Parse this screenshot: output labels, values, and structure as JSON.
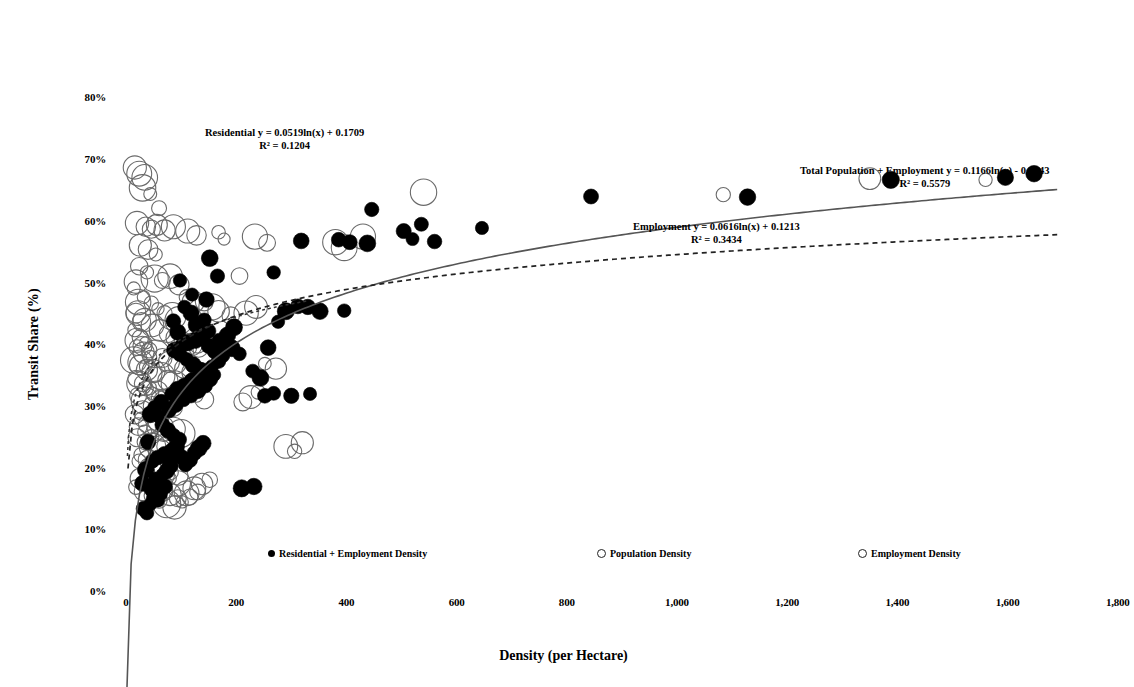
{
  "chart_data": {
    "type": "scatter",
    "title": "",
    "xlabel": "Density (per Hectare)",
    "ylabel": "Transit Share (%)",
    "xlim": [
      0,
      1800
    ],
    "ylim": [
      0,
      0.8
    ],
    "grid": false,
    "legend_position": "bottom",
    "xticks": [
      "0",
      "200",
      "400",
      "600",
      "800",
      "1,000",
      "1,200",
      "1,400",
      "1,600",
      "1,800"
    ],
    "xtick_values": [
      0,
      200,
      400,
      600,
      800,
      1000,
      1200,
      1400,
      1600,
      1800
    ],
    "yticks": [
      "0%",
      "10%",
      "20%",
      "30%",
      "40%",
      "50%",
      "60%",
      "70%",
      "80%"
    ],
    "ytick_values": [
      0,
      0.1,
      0.2,
      0.3,
      0.4,
      0.5,
      0.6,
      0.7,
      0.8
    ],
    "series": [
      {
        "name": "Residential + Employment Density",
        "marker": "filled-circle",
        "color": "#000000",
        "points": [
          [
            32,
            0.135
          ],
          [
            38,
            0.128
          ],
          [
            44,
            0.142
          ],
          [
            50,
            0.152
          ],
          [
            46,
            0.166
          ],
          [
            58,
            0.148
          ],
          [
            62,
            0.159
          ],
          [
            70,
            0.171
          ],
          [
            54,
            0.183
          ],
          [
            66,
            0.19
          ],
          [
            74,
            0.196
          ],
          [
            80,
            0.205
          ],
          [
            48,
            0.212
          ],
          [
            58,
            0.218
          ],
          [
            70,
            0.224
          ],
          [
            84,
            0.229
          ],
          [
            92,
            0.236
          ],
          [
            100,
            0.219
          ],
          [
            108,
            0.206
          ],
          [
            116,
            0.214
          ],
          [
            124,
            0.225
          ],
          [
            132,
            0.233
          ],
          [
            140,
            0.241
          ],
          [
            96,
            0.247
          ],
          [
            86,
            0.254
          ],
          [
            76,
            0.262
          ],
          [
            66,
            0.271
          ],
          [
            58,
            0.285
          ],
          [
            78,
            0.295
          ],
          [
            90,
            0.303
          ],
          [
            104,
            0.312
          ],
          [
            118,
            0.318
          ],
          [
            130,
            0.327
          ],
          [
            144,
            0.334
          ],
          [
            152,
            0.345
          ],
          [
            160,
            0.352
          ],
          [
            136,
            0.361
          ],
          [
            122,
            0.368
          ],
          [
            110,
            0.377
          ],
          [
            98,
            0.385
          ],
          [
            88,
            0.392
          ],
          [
            100,
            0.399
          ],
          [
            112,
            0.404
          ],
          [
            126,
            0.408
          ],
          [
            138,
            0.412
          ],
          [
            150,
            0.399
          ],
          [
            162,
            0.391
          ],
          [
            174,
            0.384
          ],
          [
            168,
            0.374
          ],
          [
            156,
            0.366
          ],
          [
            146,
            0.356
          ],
          [
            134,
            0.349
          ],
          [
            120,
            0.342
          ],
          [
            106,
            0.335
          ],
          [
            94,
            0.328
          ],
          [
            82,
            0.321
          ],
          [
            128,
            0.433
          ],
          [
            142,
            0.441
          ],
          [
            118,
            0.452
          ],
          [
            106,
            0.462
          ],
          [
            150,
            0.423
          ],
          [
            94,
            0.421
          ],
          [
            86,
            0.439
          ],
          [
            170,
            0.407
          ],
          [
            184,
            0.416
          ],
          [
            196,
            0.429
          ],
          [
            210,
            0.168
          ],
          [
            232,
            0.171
          ],
          [
            252,
            0.318
          ],
          [
            268,
            0.322
          ],
          [
            300,
            0.318
          ],
          [
            334,
            0.321
          ],
          [
            258,
            0.396
          ],
          [
            276,
            0.438
          ],
          [
            290,
            0.455
          ],
          [
            312,
            0.463
          ],
          [
            330,
            0.462
          ],
          [
            352,
            0.455
          ],
          [
            396,
            0.456
          ],
          [
            268,
            0.518
          ],
          [
            318,
            0.569
          ],
          [
            386,
            0.571
          ],
          [
            406,
            0.567
          ],
          [
            438,
            0.565
          ],
          [
            446,
            0.62
          ],
          [
            504,
            0.585
          ],
          [
            520,
            0.572
          ],
          [
            536,
            0.596
          ],
          [
            560,
            0.568
          ],
          [
            646,
            0.59
          ],
          [
            844,
            0.641
          ],
          [
            1128,
            0.64
          ],
          [
            1388,
            0.668
          ],
          [
            1596,
            0.672
          ],
          [
            1648,
            0.678
          ],
          [
            166,
            0.512
          ],
          [
            152,
            0.541
          ],
          [
            98,
            0.505
          ],
          [
            120,
            0.482
          ],
          [
            146,
            0.474
          ],
          [
            230,
            0.358
          ],
          [
            244,
            0.347
          ],
          [
            206,
            0.386
          ],
          [
            192,
            0.395
          ],
          [
            64,
            0.308
          ],
          [
            52,
            0.299
          ],
          [
            44,
            0.288
          ],
          [
            40,
            0.243
          ],
          [
            36,
            0.198
          ],
          [
            30,
            0.176
          ]
        ]
      },
      {
        "name": "Population Density",
        "marker": "hollow-circle",
        "color": "#666666",
        "points": [
          [
            16,
            0.688
          ],
          [
            24,
            0.678
          ],
          [
            34,
            0.672
          ],
          [
            30,
            0.655
          ],
          [
            44,
            0.645
          ],
          [
            60,
            0.622
          ],
          [
            20,
            0.598
          ],
          [
            36,
            0.592
          ],
          [
            46,
            0.588
          ],
          [
            56,
            0.595
          ],
          [
            70,
            0.586
          ],
          [
            86,
            0.592
          ],
          [
            112,
            0.585
          ],
          [
            128,
            0.578
          ],
          [
            168,
            0.583
          ],
          [
            178,
            0.572
          ],
          [
            234,
            0.576
          ],
          [
            256,
            0.566
          ],
          [
            26,
            0.562
          ],
          [
            40,
            0.555
          ],
          [
            54,
            0.547
          ],
          [
            24,
            0.528
          ],
          [
            38,
            0.518
          ],
          [
            52,
            0.508
          ],
          [
            66,
            0.505
          ],
          [
            80,
            0.512
          ],
          [
            96,
            0.498
          ],
          [
            18,
            0.503
          ],
          [
            110,
            0.478
          ],
          [
            122,
            0.47
          ],
          [
            32,
            0.478
          ],
          [
            46,
            0.468
          ],
          [
            58,
            0.459
          ],
          [
            70,
            0.452
          ],
          [
            84,
            0.447
          ],
          [
            96,
            0.44
          ],
          [
            22,
            0.452
          ],
          [
            34,
            0.441
          ],
          [
            48,
            0.432
          ],
          [
            62,
            0.424
          ],
          [
            76,
            0.418
          ],
          [
            90,
            0.412
          ],
          [
            104,
            0.406
          ],
          [
            118,
            0.401
          ],
          [
            132,
            0.396
          ],
          [
            146,
            0.392
          ],
          [
            20,
            0.408
          ],
          [
            30,
            0.399
          ],
          [
            42,
            0.392
          ],
          [
            54,
            0.386
          ],
          [
            66,
            0.379
          ],
          [
            78,
            0.373
          ],
          [
            92,
            0.368
          ],
          [
            106,
            0.362
          ],
          [
            120,
            0.356
          ],
          [
            134,
            0.349
          ],
          [
            26,
            0.372
          ],
          [
            38,
            0.365
          ],
          [
            50,
            0.358
          ],
          [
            64,
            0.35
          ],
          [
            76,
            0.343
          ],
          [
            88,
            0.337
          ],
          [
            100,
            0.33
          ],
          [
            114,
            0.324
          ],
          [
            128,
            0.318
          ],
          [
            142,
            0.312
          ],
          [
            24,
            0.338
          ],
          [
            36,
            0.33
          ],
          [
            48,
            0.322
          ],
          [
            60,
            0.314
          ],
          [
            72,
            0.307
          ],
          [
            86,
            0.299
          ],
          [
            30,
            0.294
          ],
          [
            44,
            0.286
          ],
          [
            58,
            0.278
          ],
          [
            72,
            0.271
          ],
          [
            86,
            0.264
          ],
          [
            100,
            0.257
          ],
          [
            22,
            0.268
          ],
          [
            34,
            0.259
          ],
          [
            46,
            0.251
          ],
          [
            60,
            0.243
          ],
          [
            74,
            0.236
          ],
          [
            88,
            0.228
          ],
          [
            28,
            0.222
          ],
          [
            40,
            0.214
          ],
          [
            54,
            0.207
          ],
          [
            68,
            0.2
          ],
          [
            82,
            0.194
          ],
          [
            96,
            0.188
          ],
          [
            26,
            0.184
          ],
          [
            38,
            0.176
          ],
          [
            52,
            0.17
          ],
          [
            66,
            0.164
          ],
          [
            80,
            0.158
          ],
          [
            94,
            0.152
          ],
          [
            110,
            0.16
          ],
          [
            124,
            0.168
          ],
          [
            138,
            0.175
          ],
          [
            152,
            0.182
          ],
          [
            252,
            0.37
          ],
          [
            272,
            0.362
          ],
          [
            290,
            0.236
          ],
          [
            306,
            0.228
          ],
          [
            320,
            0.242
          ],
          [
            380,
            0.567
          ],
          [
            396,
            0.558
          ],
          [
            430,
            0.576
          ],
          [
            540,
            0.648
          ],
          [
            1084,
            0.644
          ],
          [
            1350,
            0.67
          ],
          [
            1560,
            0.668
          ],
          [
            218,
            0.452
          ],
          [
            236,
            0.462
          ],
          [
            206,
            0.512
          ]
        ]
      },
      {
        "name": "Employment Density",
        "marker": "hollow-circle",
        "color": "#666666",
        "points": [
          [
            14,
            0.492
          ],
          [
            22,
            0.47
          ],
          [
            18,
            0.452
          ],
          [
            28,
            0.438
          ],
          [
            16,
            0.425
          ],
          [
            26,
            0.412
          ],
          [
            36,
            0.404
          ],
          [
            20,
            0.396
          ],
          [
            32,
            0.388
          ],
          [
            44,
            0.381
          ],
          [
            14,
            0.376
          ],
          [
            24,
            0.368
          ],
          [
            38,
            0.36
          ],
          [
            50,
            0.353
          ],
          [
            18,
            0.346
          ],
          [
            30,
            0.338
          ],
          [
            42,
            0.331
          ],
          [
            56,
            0.324
          ],
          [
            22,
            0.318
          ],
          [
            34,
            0.31
          ],
          [
            48,
            0.302
          ],
          [
            62,
            0.295
          ],
          [
            16,
            0.288
          ],
          [
            28,
            0.28
          ],
          [
            40,
            0.272
          ],
          [
            54,
            0.266
          ],
          [
            68,
            0.258
          ],
          [
            20,
            0.25
          ],
          [
            34,
            0.243
          ],
          [
            48,
            0.236
          ],
          [
            62,
            0.228
          ],
          [
            78,
            0.22
          ],
          [
            24,
            0.212
          ],
          [
            38,
            0.205
          ],
          [
            52,
            0.198
          ],
          [
            66,
            0.19
          ],
          [
            80,
            0.184
          ],
          [
            94,
            0.176
          ],
          [
            18,
            0.17
          ],
          [
            32,
            0.163
          ],
          [
            46,
            0.156
          ],
          [
            60,
            0.149
          ],
          [
            74,
            0.143
          ],
          [
            88,
            0.137
          ],
          [
            102,
            0.146
          ],
          [
            116,
            0.154
          ],
          [
            130,
            0.162
          ],
          [
            142,
            0.47
          ],
          [
            156,
            0.462
          ],
          [
            168,
            0.455
          ],
          [
            190,
            0.448
          ],
          [
            212,
            0.308
          ],
          [
            226,
            0.316
          ],
          [
            240,
            0.324
          ],
          [
            116,
            0.395
          ],
          [
            130,
            0.402
          ],
          [
            146,
            0.408
          ]
        ]
      }
    ],
    "trendlines": [
      {
        "name": "Residential",
        "label": "Residential y = 0.0519ln(x) + 0.1709",
        "r2_label": "R² = 0.1204",
        "style": "none",
        "equation": {
          "type": "log",
          "a": 0.0519,
          "b": 0.1709
        },
        "r2": 0.1204
      },
      {
        "name": "Total Population + Employment",
        "label": "Total Population + Employment y = 0.1166ln(x) - 0.2143",
        "r2_label": "R² = 0.5579",
        "style": "solid",
        "equation": {
          "type": "log",
          "a": 0.1166,
          "b": -0.2143
        },
        "r2": 0.5579
      },
      {
        "name": "Employment",
        "label": "Employment y = 0.0616ln(x) + 0.1213",
        "r2_label": "R² = 0.3434",
        "style": "dashed",
        "equation": {
          "type": "log",
          "a": 0.0616,
          "b": 0.1213
        },
        "r2": 0.3434
      }
    ],
    "legend": [
      {
        "label": "Residential + Employment Density",
        "marker": "filled-circle"
      },
      {
        "label": "Population Density",
        "marker": "hollow-circle"
      },
      {
        "label": "Employment Density",
        "marker": "hollow-circle"
      }
    ],
    "colors": {
      "filled_marker": "#000000",
      "hollow_marker": "#666666",
      "trendline": "#555555",
      "text": "#000000"
    }
  }
}
